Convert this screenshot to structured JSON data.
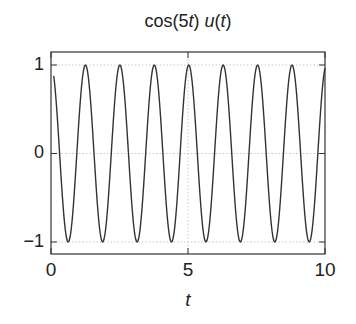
{
  "chart_data": {
    "type": "line",
    "title": "cos(5t) u(t)",
    "title_parts": {
      "func": "cos",
      "arg_open": "(5",
      "arg_var": "t",
      "arg_close": ")",
      "step": "u",
      "step_open": "(",
      "step_var": "t",
      "step_close": ")"
    },
    "xlabel": "t",
    "ylabel": "",
    "xlim": [
      0,
      10
    ],
    "ylim": [
      -1.15,
      1.15
    ],
    "xticks": [
      0,
      5,
      10
    ],
    "xtick_labels": [
      "0",
      "5",
      "10"
    ],
    "yticks": [
      -1,
      0,
      1
    ],
    "ytick_labels": [
      "−1",
      "0",
      "1"
    ],
    "grid": true,
    "legend": null,
    "series": [
      {
        "name": "cos(5t) u(t)",
        "function": "cos(5*t)",
        "t_start": 0.1,
        "t_end": 10,
        "samples": 400,
        "color": "#333333"
      }
    ]
  },
  "colors": {
    "line": "#333333",
    "frame": "#333333",
    "grid": "#bbbbbb",
    "text": "#222222"
  }
}
